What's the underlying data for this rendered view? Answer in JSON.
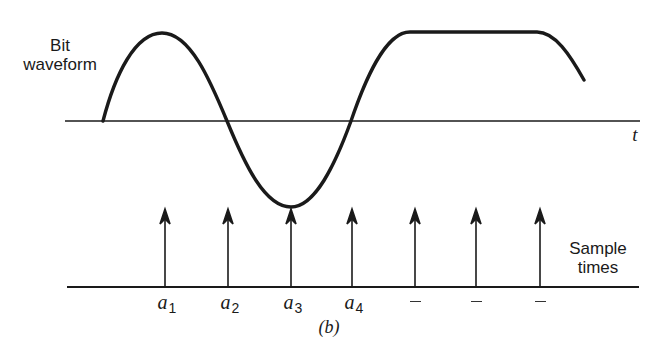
{
  "figure": {
    "panel_label": "(b)",
    "waveform_label_line1": "Bit",
    "waveform_label_line2": "waveform",
    "time_axis_label": "t",
    "sample_label_line1": "Sample",
    "sample_label_line2": "times",
    "sample_points": [
      {
        "label": "a",
        "subscript": "1",
        "x": 165
      },
      {
        "label": "a",
        "subscript": "2",
        "x": 228
      },
      {
        "label": "a",
        "subscript": "3",
        "x": 291
      },
      {
        "label": "a",
        "subscript": "4",
        "x": 352
      },
      {
        "label": "–",
        "subscript": "",
        "x": 415
      },
      {
        "label": "–",
        "subscript": "",
        "x": 476
      },
      {
        "label": "–",
        "subscript": "",
        "x": 540
      }
    ],
    "colors": {
      "stroke": "#1a1a1a",
      "background": "#ffffff"
    }
  }
}
